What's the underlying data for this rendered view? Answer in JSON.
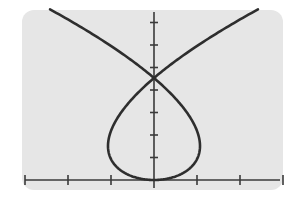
{
  "chart_data": {
    "type": "line",
    "title": "",
    "xlabel": "",
    "ylabel": "",
    "parametric": {
      "x": "t^3 - 3t",
      "y": "t^2",
      "t_range": [
        -2.24,
        2.24
      ]
    },
    "series": [
      {
        "name": "curve",
        "points": [
          [
            -4.47,
            5.0
          ],
          [
            -2.0,
            4.0
          ],
          [
            0.0,
            3.0
          ],
          [
            2.0,
            2.0
          ],
          [
            2.0,
            1.0
          ],
          [
            1.4,
            0.5
          ],
          [
            0.0,
            0.0
          ],
          [
            -1.4,
            0.5
          ],
          [
            -2.0,
            1.0
          ],
          [
            -2.0,
            2.0
          ],
          [
            0.0,
            3.0
          ],
          [
            2.0,
            4.0
          ],
          [
            4.47,
            5.0
          ]
        ]
      }
    ],
    "key_points": {
      "self_intersection": [
        0,
        3
      ],
      "loop_bottom": [
        0,
        0
      ],
      "loop_left": [
        -2,
        1
      ],
      "loop_right": [
        2,
        1
      ]
    },
    "x_ticks": [
      -6,
      -4,
      -2,
      2,
      4,
      6
    ],
    "y_ticks": [
      1,
      2,
      3,
      4,
      5,
      6
    ],
    "xlim": [
      -6.4,
      6.3
    ],
    "ylim": [
      0,
      5.1
    ],
    "grid": false,
    "legend": "none",
    "colors": {
      "panel": "#e6e6e6",
      "curve": "#2e2e2e",
      "axis": "#3a3a3a"
    }
  }
}
